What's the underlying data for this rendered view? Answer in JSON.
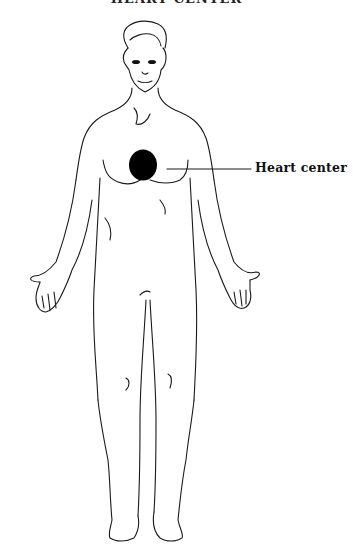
{
  "figure": {
    "title": "HEART CENTER",
    "callout": {
      "label": "Heart center",
      "marker_color": "#000000",
      "line_color": "#1a1a1a"
    }
  }
}
